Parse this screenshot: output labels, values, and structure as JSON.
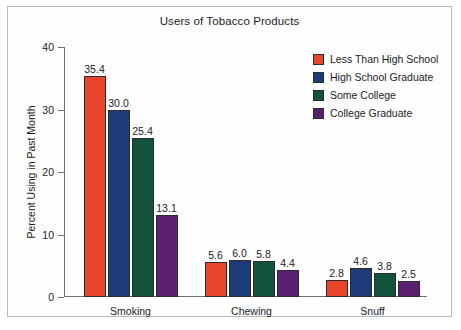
{
  "chart_data": {
    "type": "bar",
    "title": "Users of Tobacco Products",
    "xlabel": "",
    "ylabel": "Percent Using in Past Month",
    "categories": [
      "Smoking",
      "Chewing",
      "Snuff"
    ],
    "ylim": [
      0,
      40
    ],
    "yticks": [
      0,
      10,
      20,
      30,
      40
    ],
    "ytick_labels": [
      "0",
      "10",
      "20",
      "30",
      "40"
    ],
    "grid": false,
    "legend_position": "top-right",
    "value_labels": true,
    "series": [
      {
        "name": "Less Than High School",
        "color": "#E8452B",
        "values": [
          35.4,
          5.6,
          2.8
        ],
        "labels": [
          "35.4",
          "5.6",
          "2.8"
        ]
      },
      {
        "name": "High School Graduate",
        "color": "#1E3C78",
        "values": [
          30.0,
          6.0,
          4.6
        ],
        "labels": [
          "30.0",
          "6.0",
          "4.6"
        ]
      },
      {
        "name": "Some College",
        "color": "#13523C",
        "values": [
          25.4,
          5.8,
          3.8
        ],
        "labels": [
          "25.4",
          "5.8",
          "3.8"
        ]
      },
      {
        "name": "College Graduate",
        "color": "#5C2071",
        "values": [
          13.1,
          4.4,
          2.5
        ],
        "labels": [
          "13.1",
          "4.4",
          "2.5"
        ]
      }
    ]
  }
}
